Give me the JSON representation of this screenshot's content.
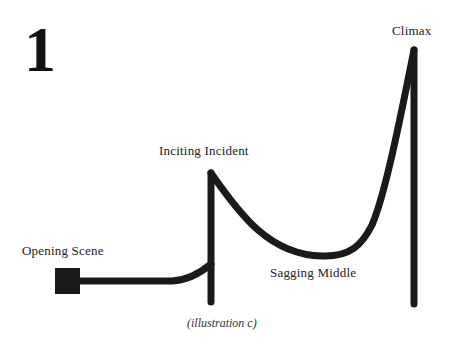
{
  "figure": {
    "number": "1",
    "caption": "(illustration c)"
  },
  "labels": {
    "opening_scene": "Opening Scene",
    "inciting_incident": "Inciting Incident",
    "sagging_middle": "Sagging Middle",
    "climax": "Climax"
  },
  "colors": {
    "stroke": "#1a1a1a",
    "background": "#ffffff"
  }
}
